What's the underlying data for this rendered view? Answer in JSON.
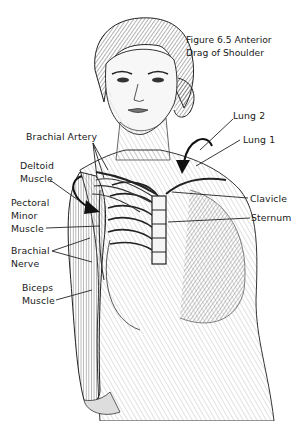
{
  "figure": {
    "caption_line1": "Figure 6.5 Anterior",
    "caption_line2": "Drag of Shoulder"
  },
  "labels": {
    "brachial_artery": "Brachial Artery",
    "deltoid_1": "Deltoid",
    "deltoid_2": "Muscle",
    "pectoral_1": "Pectoral",
    "pectoral_2": "Minor",
    "pectoral_3": "Muscle",
    "brachial_nerve_1": "Brachial",
    "brachial_nerve_2": "Nerve",
    "biceps_1": "Biceps",
    "biceps_2": "Muscle",
    "lung2": "Lung 2",
    "lung1": "Lung 1",
    "clavicle": "Clavicle",
    "sternum": "Sternum"
  },
  "colors": {
    "ink": "#1a1a1a",
    "shade": "#6e6e6e",
    "light": "#bdbdbd"
  }
}
